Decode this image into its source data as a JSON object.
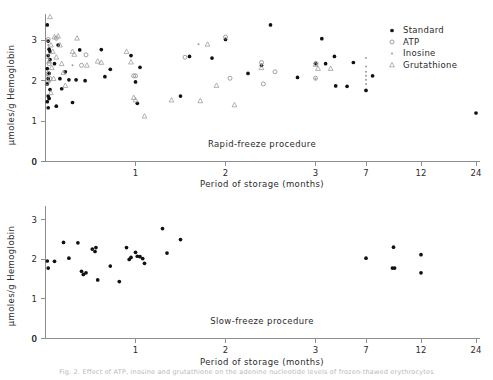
{
  "figure": {
    "caption": "Fig. 2.  Effect of ATP, inosine and grutathione on the adenine nucleotide levels of frozen-thawed erythrocytes"
  },
  "legend": {
    "position": "top-right",
    "items": [
      {
        "label": "Standard",
        "marker": "filled-circle",
        "color": "#111111"
      },
      {
        "label": "ATP",
        "marker": "open-circle",
        "color": "#8a8a8a"
      },
      {
        "label": "Inosine",
        "marker": "small-dot",
        "color": "#9a9a9a"
      },
      {
        "label": "Grutathione",
        "marker": "open-triangle",
        "color": "#9a9a9a"
      }
    ]
  },
  "chart_data": [
    {
      "type": "scatter",
      "title": "Rapid-freeze procedure",
      "xlabel": "Period of storage (months)",
      "ylabel": "μmoles/g Hemoglobin",
      "xticks": [
        0,
        1,
        2,
        3,
        7,
        12,
        24
      ],
      "xticklabels": [
        "0",
        "1",
        "2",
        "3",
        "7",
        "12",
        "24"
      ],
      "yticks": [
        0,
        1,
        2,
        3
      ],
      "yticklabels": [
        "0",
        "1",
        "2",
        "3"
      ],
      "ylim": [
        0,
        3.65
      ],
      "xscale": "compressed-nonlinear",
      "grid": false,
      "series": [
        {
          "name": "Standard",
          "marker": "filled-circle",
          "points": [
            [
              0.02,
              3.38
            ],
            [
              0.03,
              2.98
            ],
            [
              0.04,
              2.78
            ],
            [
              0.05,
              2.72
            ],
            [
              0.03,
              2.62
            ],
            [
              0.05,
              2.52
            ],
            [
              0.02,
              2.3
            ],
            [
              0.04,
              2.18
            ],
            [
              0.03,
              2.05
            ],
            [
              0.02,
              1.92
            ],
            [
              0.05,
              1.78
            ],
            [
              0.03,
              1.62
            ],
            [
              0.04,
              1.56
            ],
            [
              0.02,
              1.48
            ],
            [
              0.03,
              1.33
            ],
            [
              0.1,
              2.42
            ],
            [
              0.12,
              1.37
            ],
            [
              0.14,
              2.88
            ],
            [
              0.16,
              2.05
            ],
            [
              0.18,
              1.8
            ],
            [
              0.22,
              2.22
            ],
            [
              0.26,
              2.02
            ],
            [
              0.3,
              1.46
            ],
            [
              0.34,
              2.02
            ],
            [
              0.38,
              2.76
            ],
            [
              0.44,
              2.0
            ],
            [
              0.62,
              2.77
            ],
            [
              0.66,
              2.1
            ],
            [
              0.72,
              2.28
            ],
            [
              0.95,
              2.62
            ],
            [
              1.0,
              1.97
            ],
            [
              1.02,
              1.44
            ],
            [
              1.05,
              2.33
            ],
            [
              1.5,
              1.62
            ],
            [
              1.6,
              2.6
            ],
            [
              1.85,
              2.56
            ],
            [
              2.0,
              3.02
            ],
            [
              2.25,
              2.18
            ],
            [
              2.4,
              2.38
            ],
            [
              2.5,
              3.38
            ],
            [
              2.8,
              2.08
            ],
            [
              3.0,
              2.43
            ],
            [
              3.5,
              3.04
            ],
            [
              3.8,
              2.42
            ],
            [
              4.5,
              2.6
            ],
            [
              4.6,
              1.87
            ],
            [
              5.5,
              1.86
            ],
            [
              6.0,
              2.45
            ],
            [
              7.0,
              1.76
            ],
            [
              7.6,
              2.12
            ],
            [
              24.0,
              1.2
            ]
          ]
        },
        {
          "name": "ATP",
          "marker": "open-circle",
          "points": [
            [
              0.03,
              3.02
            ],
            [
              0.02,
              2.6
            ],
            [
              0.04,
              2.42
            ],
            [
              0.03,
              2.18
            ],
            [
              0.05,
              2.05
            ],
            [
              0.02,
              1.95
            ],
            [
              0.12,
              3.05
            ],
            [
              0.45,
              2.64
            ],
            [
              0.4,
              2.38
            ],
            [
              0.98,
              2.12
            ],
            [
              1.0,
              2.12
            ],
            [
              1.55,
              2.58
            ],
            [
              2.0,
              3.08
            ],
            [
              2.05,
              2.06
            ],
            [
              2.4,
              2.45
            ],
            [
              2.42,
              1.92
            ],
            [
              2.55,
              2.22
            ],
            [
              3.0,
              2.06
            ],
            [
              3.05,
              2.42
            ]
          ]
        },
        {
          "name": "Inosine",
          "marker": "small-dot",
          "points": [
            [
              0.03,
              2.88
            ],
            [
              0.04,
              2.46
            ],
            [
              0.02,
              2.12
            ],
            [
              0.05,
              1.98
            ],
            [
              0.3,
              2.38
            ],
            [
              1.7,
              2.9
            ],
            [
              2.4,
              2.4
            ],
            [
              3.0,
              2.05
            ],
            [
              7.0,
              2.56
            ],
            [
              7.0,
              2.35
            ],
            [
              7.0,
              2.22
            ],
            [
              7.0,
              2.12
            ],
            [
              7.0,
              2.02
            ],
            [
              7.0,
              1.92
            ]
          ]
        },
        {
          "name": "Grutathione",
          "marker": "open-triangle",
          "points": [
            [
              0.05,
              3.58
            ],
            [
              0.1,
              3.08
            ],
            [
              0.14,
              3.1
            ],
            [
              0.06,
              2.88
            ],
            [
              0.16,
              2.88
            ],
            [
              0.08,
              2.72
            ],
            [
              0.12,
              2.58
            ],
            [
              0.04,
              2.48
            ],
            [
              0.18,
              2.42
            ],
            [
              0.07,
              2.32
            ],
            [
              0.2,
              2.2
            ],
            [
              0.09,
              2.05
            ],
            [
              0.22,
              1.88
            ],
            [
              0.06,
              1.7
            ],
            [
              0.35,
              3.05
            ],
            [
              0.3,
              2.72
            ],
            [
              0.32,
              2.65
            ],
            [
              0.46,
              2.38
            ],
            [
              0.58,
              2.48
            ],
            [
              0.62,
              2.45
            ],
            [
              0.9,
              2.72
            ],
            [
              0.95,
              2.46
            ],
            [
              0.98,
              1.58
            ],
            [
              1.0,
              1.52
            ],
            [
              1.1,
              1.12
            ],
            [
              1.4,
              1.52
            ],
            [
              1.72,
              1.5
            ],
            [
              1.8,
              2.9
            ],
            [
              1.9,
              1.88
            ],
            [
              2.1,
              1.4
            ],
            [
              2.4,
              2.32
            ],
            [
              3.0,
              2.4
            ],
            [
              3.2,
              2.3
            ],
            [
              4.2,
              2.3
            ]
          ]
        }
      ]
    },
    {
      "type": "scatter",
      "title": "Slow-freeze procedure",
      "xlabel": "Period of storage (months)",
      "ylabel": "μmoles/g Hemoglobin",
      "xticks": [
        0,
        1,
        2,
        3,
        7,
        12,
        24
      ],
      "xticklabels": [
        "0",
        "1",
        "2",
        "3",
        "7",
        "12",
        "24"
      ],
      "yticks": [
        0,
        1,
        2,
        3
      ],
      "yticklabels": [
        "0",
        "1",
        "2",
        "3"
      ],
      "ylim": [
        0,
        3.35
      ],
      "xscale": "compressed-nonlinear",
      "grid": false,
      "series": [
        {
          "name": "Standard",
          "marker": "filled-circle",
          "points": [
            [
              0.02,
              1.96
            ],
            [
              0.03,
              1.78
            ],
            [
              0.1,
              1.95
            ],
            [
              0.2,
              2.43
            ],
            [
              0.26,
              2.03
            ],
            [
              0.36,
              2.42
            ],
            [
              0.4,
              1.7
            ],
            [
              0.42,
              1.62
            ],
            [
              0.45,
              1.66
            ],
            [
              0.52,
              2.26
            ],
            [
              0.55,
              2.2
            ],
            [
              0.56,
              2.3
            ],
            [
              0.58,
              1.48
            ],
            [
              0.72,
              1.83
            ],
            [
              0.82,
              1.44
            ],
            [
              0.9,
              2.3
            ],
            [
              0.93,
              2.0
            ],
            [
              0.95,
              2.05
            ],
            [
              1.0,
              2.18
            ],
            [
              1.02,
              2.08
            ],
            [
              1.05,
              2.07
            ],
            [
              1.08,
              2.02
            ],
            [
              1.1,
              1.9
            ],
            [
              1.3,
              2.78
            ],
            [
              1.35,
              2.16
            ],
            [
              1.5,
              2.5
            ],
            [
              7.0,
              2.03
            ],
            [
              9.5,
              2.31
            ],
            [
              9.4,
              1.78
            ],
            [
              9.6,
              1.78
            ],
            [
              12.0,
              2.12
            ],
            [
              12.0,
              1.66
            ]
          ]
        }
      ]
    }
  ]
}
